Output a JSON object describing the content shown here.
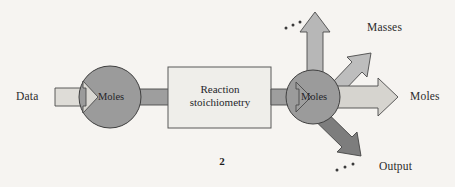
{
  "figure": {
    "type": "flow-diagram",
    "page_number": "2",
    "background_color": "#f6f4f1",
    "stroke_color": "#3a3a3a",
    "nodes": [
      {
        "id": "moles-in",
        "label": "Moles",
        "shape": "circle",
        "fill": "#9b9b9b"
      },
      {
        "id": "reaction",
        "label": "Reaction\nstoichiometry",
        "label_line1": "Reaction",
        "label_line2": "stoichiometry",
        "shape": "rectangle",
        "fill": "#efeeea"
      },
      {
        "id": "moles-out",
        "label": "Moles",
        "shape": "circle",
        "fill": "#9b9b9b"
      }
    ],
    "arrows": [
      {
        "id": "data-in",
        "label": "Data",
        "direction": "east",
        "fill": "#dedcd7"
      },
      {
        "id": "to-box",
        "label": "",
        "direction": "east",
        "fill": "#9e9e9e"
      },
      {
        "id": "from-box",
        "label": "",
        "direction": "east",
        "fill": "#9e9e9e"
      },
      {
        "id": "out-up",
        "label": "",
        "direction": "north",
        "fill": "#b7b7b7"
      },
      {
        "id": "out-masses",
        "label": "Masses",
        "direction": "north-east",
        "fill": "#bdbdbd"
      },
      {
        "id": "out-moles",
        "label": "Moles",
        "direction": "east",
        "fill": "#d6d4cf"
      },
      {
        "id": "out-output",
        "label": "Output",
        "direction": "south-east",
        "fill": "#7d7d7d"
      }
    ],
    "ellipses": [
      {
        "id": "ellipsis-top",
        "text": "...",
        "position": "upper-left-of-up-arrow"
      },
      {
        "id": "ellipsis-bottom",
        "text": "...",
        "position": "lower-left-of-output-arrow"
      }
    ]
  }
}
